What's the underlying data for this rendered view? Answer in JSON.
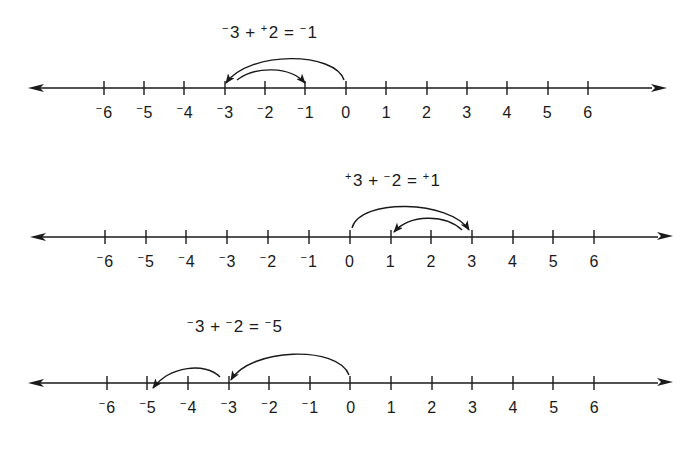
{
  "diagram": {
    "stroke_color": "#1a1a1a",
    "background": "#ffffff"
  },
  "number_lines": [
    {
      "id": "line-1",
      "equation": {
        "a_sign": "−",
        "a": "3",
        "op": "+",
        "b_sign": "+",
        "b": "2",
        "eq": "=",
        "r_sign": "−",
        "r": "1"
      },
      "equation_text": "⁻3 + ⁺2 = ⁻1",
      "ticks": [
        -6,
        -5,
        -4,
        -3,
        -2,
        -1,
        0,
        1,
        2,
        3,
        4,
        5,
        6
      ],
      "tick_labels": [
        {
          "sign": "−",
          "num": "6"
        },
        {
          "sign": "−",
          "num": "5"
        },
        {
          "sign": "−",
          "num": "4"
        },
        {
          "sign": "−",
          "num": "3"
        },
        {
          "sign": "−",
          "num": "2"
        },
        {
          "sign": "−",
          "num": "1"
        },
        {
          "sign": "",
          "num": "0"
        },
        {
          "sign": "",
          "num": "1"
        },
        {
          "sign": "",
          "num": "2"
        },
        {
          "sign": "",
          "num": "3"
        },
        {
          "sign": "",
          "num": "4"
        },
        {
          "sign": "",
          "num": "5"
        },
        {
          "sign": "",
          "num": "6"
        }
      ],
      "jumps": [
        {
          "from": 0,
          "to": -3,
          "label": "⁻3"
        },
        {
          "from": -3,
          "to": -1,
          "label": "⁺2"
        }
      ],
      "result": -1
    },
    {
      "id": "line-2",
      "equation": {
        "a_sign": "+",
        "a": "3",
        "op": "+",
        "b_sign": "−",
        "b": "2",
        "eq": "=",
        "r_sign": "+",
        "r": "1"
      },
      "equation_text": "⁺3 + ⁻2 = ⁺1",
      "ticks": [
        -6,
        -5,
        -4,
        -3,
        -2,
        -1,
        0,
        1,
        2,
        3,
        4,
        5,
        6
      ],
      "tick_labels": [
        {
          "sign": "−",
          "num": "6"
        },
        {
          "sign": "−",
          "num": "5"
        },
        {
          "sign": "−",
          "num": "4"
        },
        {
          "sign": "−",
          "num": "3"
        },
        {
          "sign": "−",
          "num": "2"
        },
        {
          "sign": "−",
          "num": "1"
        },
        {
          "sign": "",
          "num": "0"
        },
        {
          "sign": "",
          "num": "1"
        },
        {
          "sign": "",
          "num": "2"
        },
        {
          "sign": "",
          "num": "3"
        },
        {
          "sign": "",
          "num": "4"
        },
        {
          "sign": "",
          "num": "5"
        },
        {
          "sign": "",
          "num": "6"
        }
      ],
      "jumps": [
        {
          "from": 0,
          "to": 3,
          "label": "⁺3"
        },
        {
          "from": 3,
          "to": 1,
          "label": "⁻2"
        }
      ],
      "result": 1
    },
    {
      "id": "line-3",
      "equation": {
        "a_sign": "−",
        "a": "3",
        "op": "+",
        "b_sign": "−",
        "b": "2",
        "eq": "=",
        "r_sign": "−",
        "r": "5"
      },
      "equation_text": "⁻3 + ⁻2 = ⁻5",
      "ticks": [
        -6,
        -5,
        -4,
        -3,
        -2,
        -1,
        0,
        1,
        2,
        3,
        4,
        5,
        6
      ],
      "tick_labels": [
        {
          "sign": "−",
          "num": "6"
        },
        {
          "sign": "−",
          "num": "5"
        },
        {
          "sign": "−",
          "num": "4"
        },
        {
          "sign": "−",
          "num": "3"
        },
        {
          "sign": "−",
          "num": "2"
        },
        {
          "sign": "−",
          "num": "1"
        },
        {
          "sign": "",
          "num": "0"
        },
        {
          "sign": "",
          "num": "1"
        },
        {
          "sign": "",
          "num": "2"
        },
        {
          "sign": "",
          "num": "3"
        },
        {
          "sign": "",
          "num": "4"
        },
        {
          "sign": "",
          "num": "5"
        },
        {
          "sign": "",
          "num": "6"
        }
      ],
      "jumps": [
        {
          "from": 0,
          "to": -3,
          "label": "⁻3"
        },
        {
          "from": -3,
          "to": -5,
          "label": "⁻2"
        }
      ],
      "result": -5
    }
  ]
}
